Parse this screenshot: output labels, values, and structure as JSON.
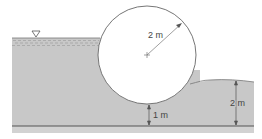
{
  "diagram": {
    "type": "cylinder-gate-hydrostatic",
    "labels": {
      "radius": "2 m",
      "gap_below_cylinder": "1 m",
      "downstream_depth": "2 m"
    },
    "colors": {
      "water": "#c8c8c8",
      "ground": "#d2d2d2",
      "line": "#555555",
      "background": "#ffffff"
    },
    "symbols": {
      "free_surface": "free-surface-triangle",
      "center": "center-cross"
    }
  }
}
